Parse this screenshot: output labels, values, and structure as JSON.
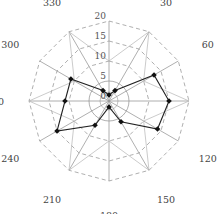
{
  "chart_data": {
    "type": "radar",
    "title": "",
    "angles": [
      0,
      30,
      60,
      90,
      120,
      150,
      180,
      210,
      240,
      270,
      300,
      330
    ],
    "angle_labels": [
      "0",
      "30",
      "60",
      "90",
      "120",
      "150",
      "180",
      "210",
      "240",
      "270",
      "300",
      "330"
    ],
    "radial_ticks": [
      0,
      5,
      10,
      15,
      20
    ],
    "radial_tick_labels": [
      "0",
      "5",
      "10",
      "15",
      "20"
    ],
    "rlim": [
      0,
      20
    ],
    "grid": true,
    "series": [
      {
        "name": "series-1",
        "values": [
          1.5,
          3,
          13,
          15,
          14,
          6,
          1.5,
          7,
          15,
          11,
          11,
          3
        ],
        "marker": "diamond",
        "color": "#111111"
      }
    ]
  },
  "style": {
    "grid_color": "#9a9a9a",
    "line_color": "#222222",
    "label_color": "#444444"
  }
}
